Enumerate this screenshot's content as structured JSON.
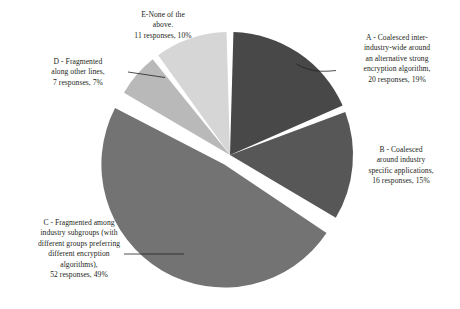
{
  "chart_data": {
    "type": "pie",
    "title": "",
    "subtitle": "",
    "xlabel": "",
    "ylabel": "",
    "legend_position": "none",
    "grid": false,
    "total_responses": 106,
    "categories": [
      "A - Coalesced inter-industry-wide around an alternative strong encryption algorithm",
      "B - Coalesced around industry specific applications",
      "C - Fragmented among industry subgroups (with different groups preferring different encryption algorithms)",
      "D - Fragmented along other lines",
      "E-None of the above."
    ],
    "values": [
      20,
      16,
      52,
      7,
      11
    ],
    "percentages": [
      19,
      15,
      49,
      7,
      10
    ],
    "slices": [
      {
        "key": "A",
        "label_lines": [
          "A - Coalesced inter-",
          "industry-wide around",
          "an alternative strong",
          "encryption algorithm,",
          "20 responses, 19%"
        ],
        "responses": 20,
        "responses_text": "20 responses",
        "percent": 19,
        "percent_text": "19%",
        "color": "#484848",
        "exploded": false
      },
      {
        "key": "B",
        "label_lines": [
          "B - Coalesced",
          "around industry",
          "specific applications,",
          "16 responses, 15%"
        ],
        "responses": 16,
        "responses_text": "16 responses",
        "percent": 15,
        "percent_text": "15%",
        "color": "#575757",
        "exploded": false
      },
      {
        "key": "C",
        "label_lines": [
          "C - Fragmented among",
          "industry subgroups (with",
          "different groups preferring",
          "different encryption",
          "algorithms),",
          "52 responses, 49%"
        ],
        "responses": 52,
        "responses_text": "52 responses",
        "percent": 49,
        "percent_text": "49%",
        "color": "#737373",
        "exploded": true
      },
      {
        "key": "D",
        "label_lines": [
          "D - Fragmented",
          "along other lines,",
          "7 responses, 7%"
        ],
        "responses": 7,
        "responses_text": "7 responses",
        "percent": 7,
        "percent_text": "7%",
        "color": "#b9b9b9",
        "exploded": false
      },
      {
        "key": "E",
        "label_lines": [
          "E-None of the",
          "above.",
          "11 responses, 10%"
        ],
        "responses": 11,
        "responses_text": "11 responses",
        "percent": 10,
        "percent_text": "10%",
        "color": "#d6d6d6",
        "exploded": false
      }
    ]
  },
  "labels": {
    "a": "A - Coalesced inter-\nindustry-wide around\nan alternative strong\nencryption algorithm,\n20 responses, 19%",
    "b": "B - Coalesced\naround industry\nspecific applications,\n16 responses, 15%",
    "c": "C - Fragmented among\nindustry subgroups (with\ndifferent groups preferring\ndifferent encryption\nalgorithms),\n52 responses, 49%",
    "d": "D - Fragmented\nalong other lines,\n7 responses, 7%",
    "e": "E-None of the\nabove.\n11 responses, 10%"
  },
  "style": {
    "background": "#ffffff",
    "text_color": "#231f20",
    "leader_line_color": "#231f20",
    "slice_gap_color": "#ffffff"
  }
}
